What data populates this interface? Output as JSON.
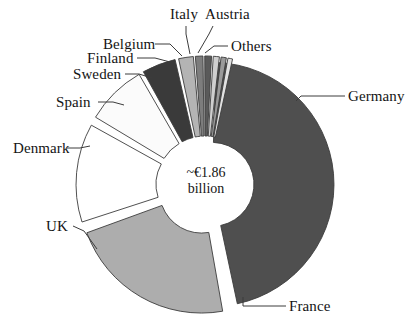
{
  "chart_data": {
    "type": "pie",
    "title": "",
    "subtitle": "",
    "xlabel": "",
    "ylabel": "",
    "center_annotation": {
      "line1": "~€1.86",
      "line2": "billion"
    },
    "legend_position": "callout-labels",
    "grid": false,
    "donut": true,
    "exploded": true,
    "categories": [
      "Germany",
      "France",
      "UK",
      "Denmark",
      "Spain",
      "Sweden",
      "Finland",
      "Belgium",
      "Italy",
      "Austria",
      "Others"
    ],
    "values": [
      46.0,
      22.0,
      13.0,
      8.0,
      4.6,
      1.9,
      1.0,
      0.9,
      0.8,
      0.7,
      0.6
    ],
    "unit": "percent of total",
    "colors": [
      "#4f4f4f",
      "#adadad",
      "#ffffff",
      "#fbfbfb",
      "#3a3a3a",
      "#b4b4b4",
      "#7d7d7d",
      "#5a5a5a",
      "#cfcfcf",
      "#9a9a9a",
      "#e2e2e2"
    ],
    "slices": [
      {
        "label": "Germany",
        "value": 46.0,
        "color": "#4f4f4f",
        "start_deg": -88,
        "end_deg": 78
      },
      {
        "label": "France",
        "value": 22.0,
        "color": "#adadad",
        "start_deg": 80,
        "end_deg": 160
      },
      {
        "label": "UK",
        "value": 13.0,
        "color": "#ffffff",
        "start_deg": 162,
        "end_deg": 209
      },
      {
        "label": "Denmark",
        "value": 8.0,
        "color": "#fbfbfb",
        "start_deg": 211,
        "end_deg": 240
      },
      {
        "label": "Spain",
        "value": 4.6,
        "color": "#3a3a3a",
        "start_deg": 241,
        "end_deg": 257
      },
      {
        "label": "Sweden",
        "value": 1.9,
        "color": "#b4b4b4",
        "start_deg": 258,
        "end_deg": 265
      },
      {
        "label": "Finland",
        "value": 1.0,
        "color": "#7d7d7d",
        "start_deg": 265.6,
        "end_deg": 269.2
      },
      {
        "label": "Belgium",
        "value": 0.9,
        "color": "#5a5a5a",
        "start_deg": 269.8,
        "end_deg": 273.0
      },
      {
        "label": "Italy",
        "value": 0.8,
        "color": "#cfcfcf",
        "start_deg": 273.6,
        "end_deg": 276.5
      },
      {
        "label": "Austria",
        "value": 0.7,
        "color": "#9a9a9a",
        "start_deg": 277.1,
        "end_deg": 279.6
      },
      {
        "label": "Others",
        "value": 0.6,
        "color": "#e2e2e2",
        "start_deg": 280.2,
        "end_deg": 282.4
      }
    ]
  },
  "labels": {
    "italy": "Italy",
    "austria": "Austria",
    "belgium": "Belgium",
    "others": "Others",
    "finland": "Finland",
    "sweden": "Sweden",
    "spain": "Spain",
    "denmark": "Denmark",
    "uk": "UK",
    "france": "France",
    "germany": "Germany"
  },
  "center": {
    "line1": "~€1.86",
    "line2": "billion"
  },
  "style": {
    "stroke": "#3c3c3c",
    "background": "#ffffff"
  }
}
